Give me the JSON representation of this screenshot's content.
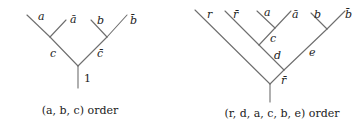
{
  "diagrams": [
    {
      "id": "left-tree",
      "caption": "(a, b, c) order",
      "labels": {
        "a": "a",
        "a_bar": "ā",
        "b": "b",
        "b_bar": "b̄",
        "c": "c",
        "c_bar": "c̄",
        "root": "1"
      }
    },
    {
      "id": "right-tree",
      "caption": "(r, d, a, c, b, e) order",
      "labels": {
        "r": "r",
        "r_bar_leaf": "r̄",
        "a": "a",
        "a_bar": "ā",
        "b": "b",
        "b_bar": "b̄",
        "c": "c",
        "d": "d",
        "e": "e",
        "r_bar_root": "r̄"
      }
    }
  ]
}
